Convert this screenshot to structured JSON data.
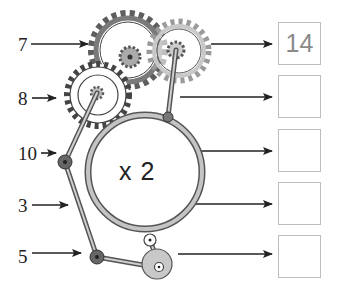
{
  "worksheet": {
    "operation": "x 2",
    "inputs": [
      {
        "value": "7",
        "y": 35
      },
      {
        "value": "8",
        "y": 89
      },
      {
        "value": "10",
        "y": 144
      },
      {
        "value": "3",
        "y": 196
      },
      {
        "value": "5",
        "y": 247
      }
    ],
    "outputs": [
      {
        "value": "14",
        "y": 22
      },
      {
        "value": "",
        "y": 75
      },
      {
        "value": "",
        "y": 129
      },
      {
        "value": "",
        "y": 182
      },
      {
        "value": "",
        "y": 235
      }
    ]
  },
  "colors": {
    "ink": "#222222",
    "dark_gear": "#6b6b6b",
    "light_gear": "#bdbdbd",
    "box_border": "#bdbdbd",
    "answer_text": "#8a8a8a"
  }
}
